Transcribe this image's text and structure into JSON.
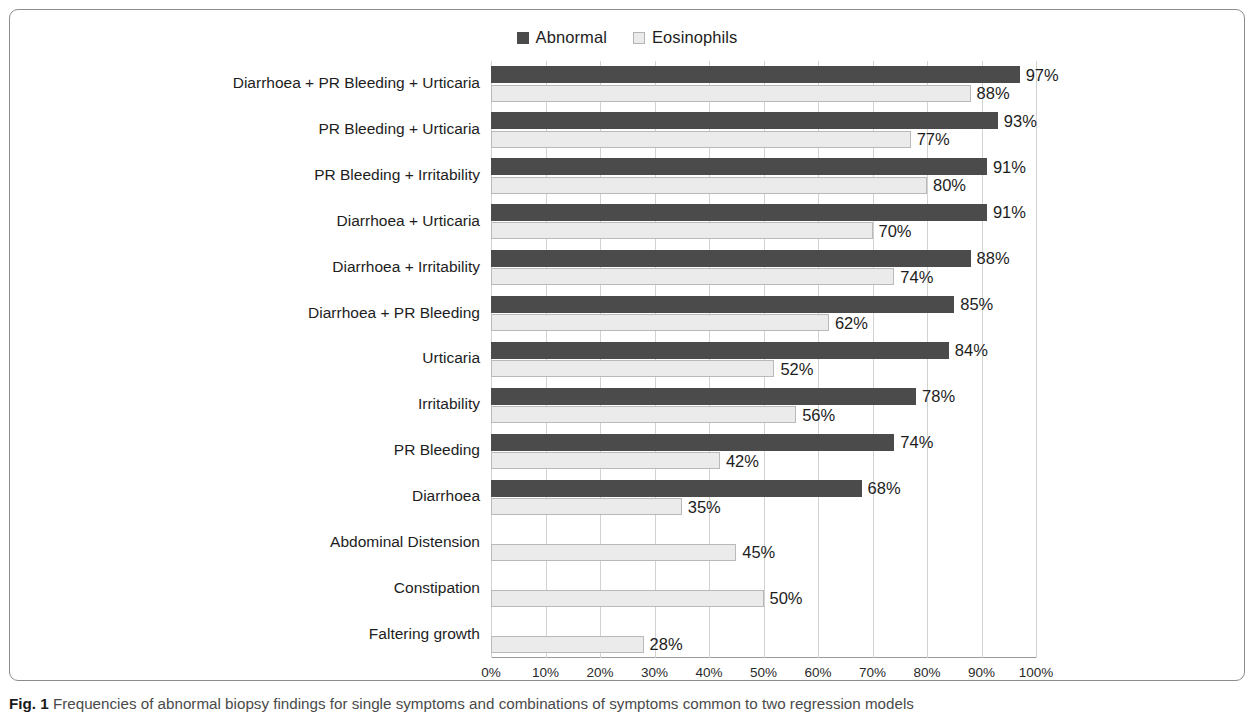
{
  "figure": {
    "caption_prefix": "Fig. 1",
    "caption_text": "Frequencies of abnormal biopsy findings for single symptoms and combinations of symptoms common to two regression models"
  },
  "legend": {
    "entries": [
      {
        "label": "Abnormal",
        "color": "#4b4b4b",
        "swatch": "filled-square-icon"
      },
      {
        "label": "Eosinophils",
        "color": "#ebebeb",
        "swatch": "outlined-square-icon"
      }
    ]
  },
  "axis": {
    "x_ticks": [
      "0%",
      "10%",
      "20%",
      "30%",
      "40%",
      "50%",
      "60%",
      "70%",
      "80%",
      "90%",
      "100%"
    ]
  },
  "chart_data": {
    "type": "bar",
    "orientation": "horizontal",
    "title": "",
    "xlabel": "",
    "ylabel": "",
    "xlim": [
      0,
      100
    ],
    "xticks": [
      0,
      10,
      20,
      30,
      40,
      50,
      60,
      70,
      80,
      90,
      100
    ],
    "xtick_labels": [
      "0%",
      "10%",
      "20%",
      "30%",
      "40%",
      "50%",
      "60%",
      "70%",
      "80%",
      "90%",
      "100%"
    ],
    "grid": true,
    "legend_position": "top-center",
    "value_label_suffix": "%",
    "categories": [
      "Diarrhoea + PR Bleeding + Urticaria",
      "PR Bleeding + Urticaria",
      "PR Bleeding + Irritability",
      "Diarrhoea + Urticaria",
      "Diarrhoea + Irritability",
      "Diarrhoea + PR Bleeding",
      "Urticaria",
      "Irritability",
      "PR Bleeding",
      "Diarrhoea",
      "Abdominal Distension",
      "Constipation",
      "Faltering growth"
    ],
    "series": [
      {
        "name": "Abnormal",
        "color": "#4b4b4b",
        "values": [
          97,
          93,
          91,
          91,
          88,
          85,
          84,
          78,
          74,
          68,
          null,
          null,
          null
        ],
        "labels": [
          "97%",
          "93%",
          "91%",
          "91%",
          "88%",
          "85%",
          "84%",
          "78%",
          "74%",
          "68%",
          "",
          "",
          ""
        ]
      },
      {
        "name": "Eosinophils",
        "color": "#ebebeb",
        "values": [
          88,
          77,
          80,
          70,
          74,
          62,
          52,
          56,
          42,
          35,
          45,
          50,
          28
        ],
        "labels": [
          "88%",
          "77%",
          "80%",
          "70%",
          "74%",
          "62%",
          "52%",
          "56%",
          "42%",
          "35%",
          "45%",
          "50%",
          "28%"
        ]
      }
    ]
  }
}
